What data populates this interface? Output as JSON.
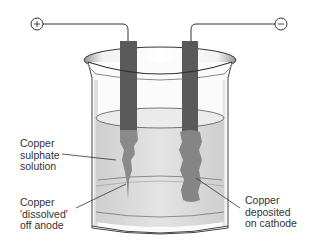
{
  "diagram": {
    "terminals": {
      "positive": "+",
      "negative": "−"
    },
    "labels": {
      "solution": "Copper\nsulphate\nsolution",
      "anode": "Copper\n'dissolved'\noff anode",
      "cathode": "Copper\ndeposited\non cathode"
    },
    "colors": {
      "electrode": "#5a5a5a",
      "copper": "#8a8a8a",
      "liquid": "#dcdcdc",
      "glass_edge": "#444444"
    }
  }
}
